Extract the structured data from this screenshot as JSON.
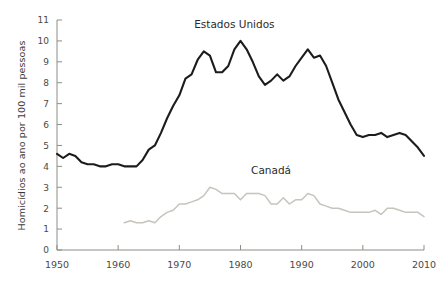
{
  "chart_data": {
    "type": "line",
    "title": "",
    "xlabel": "",
    "ylabel": "Homicídios ao ano por 100 mil pessoas",
    "xlim": [
      1950,
      2010
    ],
    "ylim": [
      0,
      11
    ],
    "grid": false,
    "legend_position": "inline-annotation",
    "x_ticks": [
      "1950",
      "1960",
      "1970",
      "1980",
      "1990",
      "2000",
      "2010"
    ],
    "y_ticks": [
      "0",
      "1",
      "2",
      "3",
      "4",
      "5",
      "6",
      "7",
      "8",
      "9",
      "10",
      "11"
    ],
    "colors": {
      "estados_unidos": "#1c1c1a",
      "canada": "#c6c4bd",
      "axis": "#8d8d88",
      "text": "#3a3a38",
      "background": "#ffffff"
    },
    "series": [
      {
        "name": "Estados Unidos",
        "color": "#1c1c1a",
        "label_x": 1979,
        "label_y": 10.6,
        "x": [
          1950,
          1951,
          1952,
          1953,
          1954,
          1955,
          1956,
          1957,
          1958,
          1959,
          1960,
          1961,
          1962,
          1963,
          1964,
          1965,
          1966,
          1967,
          1968,
          1969,
          1970,
          1971,
          1972,
          1973,
          1974,
          1975,
          1976,
          1977,
          1978,
          1979,
          1980,
          1981,
          1982,
          1983,
          1984,
          1985,
          1986,
          1987,
          1988,
          1989,
          1990,
          1991,
          1992,
          1993,
          1994,
          1995,
          1996,
          1997,
          1998,
          1999,
          2000,
          2001,
          2002,
          2003,
          2004,
          2005,
          2006,
          2007,
          2008,
          2009,
          2010
        ],
        "values": [
          4.6,
          4.4,
          4.6,
          4.5,
          4.2,
          4.1,
          4.1,
          4.0,
          4.0,
          4.1,
          4.1,
          4.0,
          4.0,
          4.0,
          4.3,
          4.8,
          5.0,
          5.6,
          6.3,
          6.9,
          7.4,
          8.2,
          8.4,
          9.1,
          9.5,
          9.3,
          8.5,
          8.5,
          8.8,
          9.6,
          10.0,
          9.6,
          9.0,
          8.3,
          7.9,
          8.1,
          8.4,
          8.1,
          8.3,
          8.8,
          9.2,
          9.6,
          9.2,
          9.3,
          8.8,
          8.0,
          7.2,
          6.6,
          6.0,
          5.5,
          5.4,
          5.5,
          5.5,
          5.6,
          5.4,
          5.5,
          5.6,
          5.5,
          5.2,
          4.9,
          4.5
        ]
      },
      {
        "name": "Canadá",
        "color": "#c6c4bd",
        "label_x": 1985,
        "label_y": 3.65,
        "x": [
          1961,
          1962,
          1963,
          1964,
          1965,
          1966,
          1967,
          1968,
          1969,
          1970,
          1971,
          1972,
          1973,
          1974,
          1975,
          1976,
          1977,
          1978,
          1979,
          1980,
          1981,
          1982,
          1983,
          1984,
          1985,
          1986,
          1987,
          1988,
          1989,
          1990,
          1991,
          1992,
          1993,
          1994,
          1995,
          1996,
          1997,
          1998,
          1999,
          2000,
          2001,
          2002,
          2003,
          2004,
          2005,
          2006,
          2007,
          2008,
          2009,
          2010
        ],
        "values": [
          1.3,
          1.4,
          1.3,
          1.3,
          1.4,
          1.3,
          1.6,
          1.8,
          1.9,
          2.2,
          2.2,
          2.3,
          2.4,
          2.6,
          3.0,
          2.9,
          2.7,
          2.7,
          2.7,
          2.4,
          2.7,
          2.7,
          2.7,
          2.6,
          2.2,
          2.2,
          2.5,
          2.2,
          2.4,
          2.4,
          2.7,
          2.6,
          2.2,
          2.1,
          2.0,
          2.0,
          1.9,
          1.8,
          1.8,
          1.8,
          1.8,
          1.9,
          1.7,
          2.0,
          2.0,
          1.9,
          1.8,
          1.8,
          1.8,
          1.6
        ]
      }
    ]
  }
}
